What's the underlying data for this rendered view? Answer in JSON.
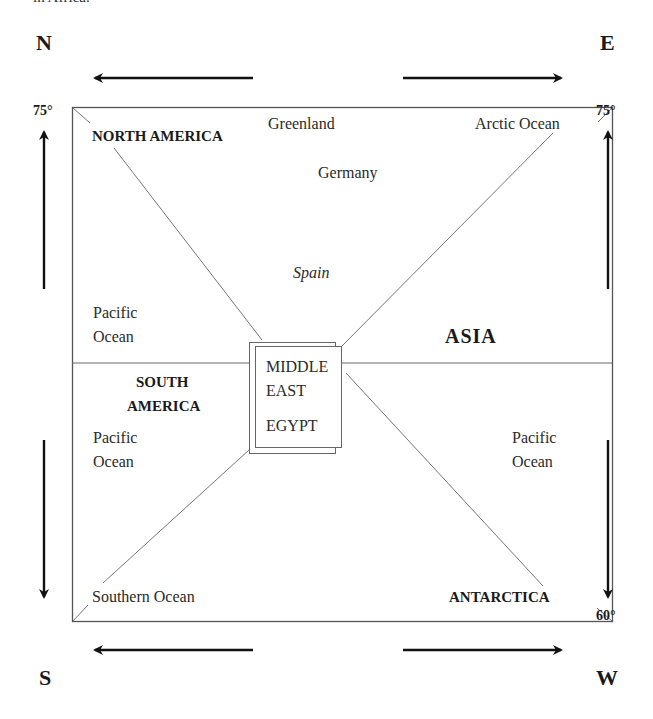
{
  "caption_fragment": "in Africa.",
  "compass": {
    "north": "N",
    "east": "E",
    "south": "S",
    "west": "W"
  },
  "latitudes": {
    "top_left": "75°",
    "top_right": "75°",
    "bottom_right": "60°"
  },
  "regions": {
    "north_america": "NORTH AMERICA",
    "south_america_line1": "SOUTH",
    "south_america_line2": "AMERICA",
    "asia": "ASIA",
    "antarctica": "ANTARCTICA"
  },
  "places": {
    "greenland": "Greenland",
    "germany": "Germany",
    "spain": "Spain",
    "arctic_ocean": "Arctic Ocean",
    "southern_ocean": "Southern Ocean",
    "pacific_nw_line1": "Pacific",
    "pacific_nw_line2": "Ocean",
    "pacific_sw_line1": "Pacific",
    "pacific_sw_line2": "Ocean",
    "pacific_se_line1": "Pacific",
    "pacific_se_line2": "Ocean"
  },
  "center_box": {
    "line1": "MIDDLE",
    "line2": "EAST",
    "line3": "EGYPT"
  },
  "colors": {
    "frame": "#555555",
    "arrow": "#111111",
    "text": "#222222"
  }
}
